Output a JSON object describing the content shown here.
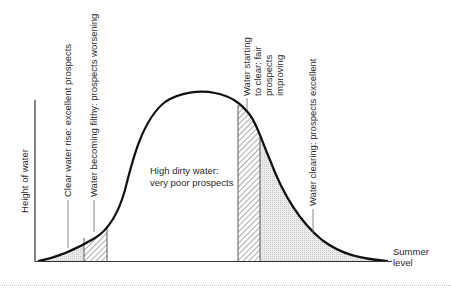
{
  "diagram": {
    "type": "river-height-curve",
    "y_axis_label": "Height of water",
    "baseline_label_line1": "Summer",
    "baseline_label_line2": "level",
    "center_label_line1": "High dirty water:",
    "center_label_line2": "very poor prospects",
    "annotations": [
      {
        "id": "clear-rise",
        "text": "Clear water rise: excellent prospects",
        "fill": "dotted-grey"
      },
      {
        "id": "becoming-filthy",
        "text": "Water becoming filthy: prospects worsening",
        "fill": "hatched"
      },
      {
        "id": "starting-to-clear",
        "lines": [
          "Water starting",
          "to clear: fair",
          "prospects",
          "improving"
        ],
        "fill": "hatched"
      },
      {
        "id": "clearing",
        "text": "Water clearing: prospects excellent",
        "fill": "dotted-grey"
      }
    ],
    "colors": {
      "curve": "#111111",
      "axis": "#333333",
      "dotted_fill": "#e4e4e4",
      "hatch": "#444444",
      "separator": "#c8c8c8"
    }
  }
}
